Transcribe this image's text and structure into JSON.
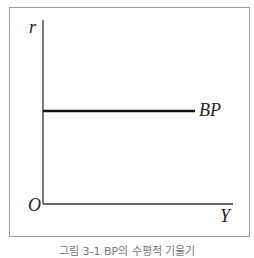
{
  "diagram": {
    "type": "economics-graph",
    "axes": {
      "y_label": "r",
      "x_label": "Y",
      "origin_label": "O"
    },
    "curves": [
      {
        "name": "BP",
        "label": "BP",
        "orientation": "horizontal",
        "color": "#111111"
      }
    ],
    "caption": "그림 3-1 BP의 수평적 기울기"
  }
}
